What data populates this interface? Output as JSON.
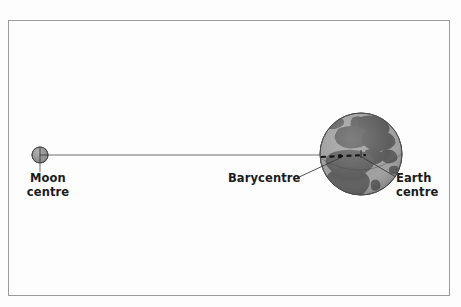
{
  "figure": {
    "background_color": "#fdfdfd",
    "frame_color": "#9a9a9a"
  },
  "labels": {
    "moon": {
      "line1": "Moon",
      "line2": "centre"
    },
    "barycentre": {
      "line1": "Barycentre"
    },
    "earth": {
      "line1": "Earth",
      "line2": "centre"
    }
  },
  "bodies": {
    "moon": {
      "name": "Moon",
      "cx": 40,
      "cy": 155,
      "r": 8,
      "fill": "#8f8f8f",
      "stroke": "#4a4a4a"
    },
    "earth": {
      "name": "Earth",
      "cx": 361,
      "cy": 154,
      "r": 41,
      "ocean_fill": "#9d9d9d",
      "land_fill": "#5d5d5d",
      "stroke": "#4a4a4a"
    }
  },
  "markers": {
    "barycentre": {
      "name": "Barycentre",
      "x": 339,
      "y": 157,
      "style": "dashed-segment",
      "color": "#1f1f1f"
    },
    "earth_centre": {
      "name": "Earth centre",
      "x": 361,
      "y": 154
    },
    "moon_centre": {
      "name": "Moon centre",
      "x": 40,
      "y": 155
    }
  },
  "connector": {
    "name": "moon-earth-axis",
    "from_x": 40,
    "from_y": 155,
    "to_x": 368,
    "to_y": 155,
    "color": "#6e6e6e"
  },
  "leaders": {
    "moon": {
      "x1": 40,
      "y1": 163,
      "x2": 40,
      "y2": 172,
      "color": "#6e6e6e"
    },
    "barycentre": {
      "x1": 296,
      "y1": 178,
      "x2": 340,
      "y2": 158,
      "color": "#3d3d3d"
    },
    "earth": {
      "x1": 396,
      "y1": 178,
      "x2": 360,
      "y2": 156,
      "color": "#3d3d3d"
    }
  }
}
